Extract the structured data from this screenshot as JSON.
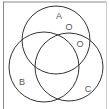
{
  "diagram": {
    "type": "venn",
    "sets": [
      {
        "id": "A",
        "label": "A",
        "cx": 56,
        "cy": 40,
        "r": 34
      },
      {
        "id": "B",
        "label": "B",
        "cx": 44,
        "cy": 67,
        "r": 35
      },
      {
        "id": "C",
        "label": "C",
        "cx": 69,
        "cy": 67,
        "r": 34
      }
    ],
    "markers": [
      {
        "label": "O",
        "region": "A only",
        "x": 69,
        "y": 30
      },
      {
        "label": "O",
        "region": "A and C (not B)",
        "x": 80,
        "y": 47
      }
    ],
    "colors": {
      "stroke": "#333333",
      "frame": "#777777",
      "text": "#555555",
      "background": "#ffffff"
    }
  }
}
